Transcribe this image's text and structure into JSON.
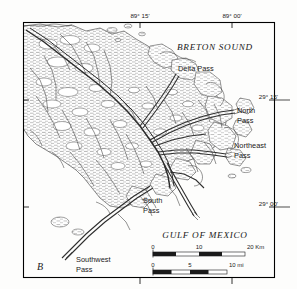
{
  "figure": {
    "panel_label": "B",
    "frame": {
      "x": 23,
      "y": 22,
      "width": 252,
      "height": 256
    }
  },
  "water_labels": [
    {
      "id": "breton-sound",
      "text": "BRETON SOUND",
      "x": 215,
      "y": 50,
      "style": "serif-italic",
      "size": 9.2,
      "spacing": 0.7
    },
    {
      "id": "gulf-of-mexico",
      "text": "GULF OF MEXICO",
      "x": 205,
      "y": 238,
      "style": "serif-italic",
      "size": 9.2,
      "spacing": 0.7
    }
  ],
  "place_labels": [
    {
      "id": "delta-pass",
      "lines": [
        "Delta Pass"
      ],
      "x": 178,
      "y": 71,
      "anchor": "start",
      "size": 7.4
    },
    {
      "id": "north-pass",
      "lines": [
        "North",
        "Pass"
      ],
      "x": 237,
      "y": 113,
      "anchor": "start",
      "size": 7.4
    },
    {
      "id": "northeast-pass",
      "lines": [
        "Northeast",
        "Pass"
      ],
      "x": 234,
      "y": 148,
      "anchor": "start",
      "size": 7.4
    },
    {
      "id": "south-pass",
      "lines": [
        "South",
        "Pass"
      ],
      "x": 143,
      "y": 203,
      "anchor": "start",
      "size": 7.4
    },
    {
      "id": "southwest-pass",
      "lines": [
        "Southwest",
        "Pass"
      ],
      "x": 76,
      "y": 262,
      "anchor": "start",
      "size": 7.4
    }
  ],
  "graticule": {
    "longitude": [
      {
        "id": "lon-89-15",
        "text": "89° 15'",
        "x": 140,
        "label_x": 140,
        "label_y": 18
      },
      {
        "id": "lon-89-00",
        "text": "89° 00'",
        "x": 232,
        "label_x": 232,
        "label_y": 18
      }
    ],
    "latitude": [
      {
        "id": "lat-29-15",
        "text": "29° 15'",
        "y": 100,
        "label_x": 278,
        "label_y": 99
      },
      {
        "id": "lat-29-00",
        "text": "29° 00'",
        "y": 207,
        "label_x": 278,
        "label_y": 206
      }
    ]
  },
  "scale_bars": [
    {
      "id": "scale-km",
      "unit": "Km",
      "ticks": [
        "0",
        "10",
        "20"
      ],
      "tick_label_unit": "20 Km",
      "x": 153,
      "y": 252,
      "width": 92,
      "height": 4,
      "segments": 4
    },
    {
      "id": "scale-mi",
      "unit": "mi",
      "ticks": [
        "0",
        "5",
        "10"
      ],
      "tick_label_unit": "10 mi",
      "x": 153,
      "y": 270,
      "width": 74,
      "height": 4,
      "segments": 4
    }
  ],
  "colors": {
    "ink": "#1a1a1a",
    "line": "#2b2b2b",
    "marsh": "#6d6d6d",
    "paper": "#fdfdfc",
    "frame": "#000000"
  }
}
